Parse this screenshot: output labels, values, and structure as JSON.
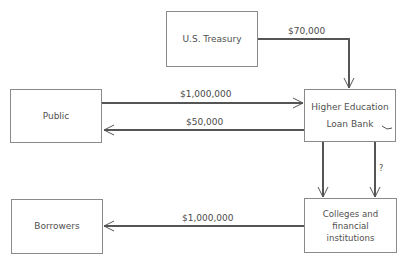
{
  "nodes": {
    "treasury": {
      "label": "U.S.  Treasury"
    },
    "public": {
      "label": "Public"
    },
    "bank": {
      "line1": "Higher Education",
      "line2": "Loan Bank"
    },
    "borrowers": {
      "label": "Borrowers"
    },
    "colleges": {
      "line1": "Colleges and financial",
      "line2": "institutions"
    }
  },
  "flows": {
    "treasury_to_bank": "$70,000",
    "public_to_bank": "$1,000,000",
    "bank_to_public": "$50,000",
    "bank_to_colleges_unknown": "?",
    "colleges_to_borrowers": "$1,000,000"
  },
  "colors": {
    "line": "#555555",
    "box_border": "#8a8a8a"
  }
}
